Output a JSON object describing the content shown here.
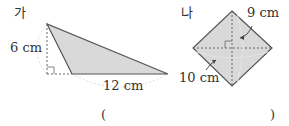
{
  "figures": {
    "ga": {
      "label": "가",
      "shape": "triangle",
      "height_label": "6 cm",
      "base_label": "12 cm",
      "fill": "#d9d9d9"
    },
    "na": {
      "label": "나",
      "shape": "rhombus",
      "diagonal1_label": "9 cm",
      "diagonal2_label": "10 cm",
      "fill": "#d9d9d9"
    }
  },
  "answer": {
    "open_paren": "(",
    "close_paren": ")"
  }
}
